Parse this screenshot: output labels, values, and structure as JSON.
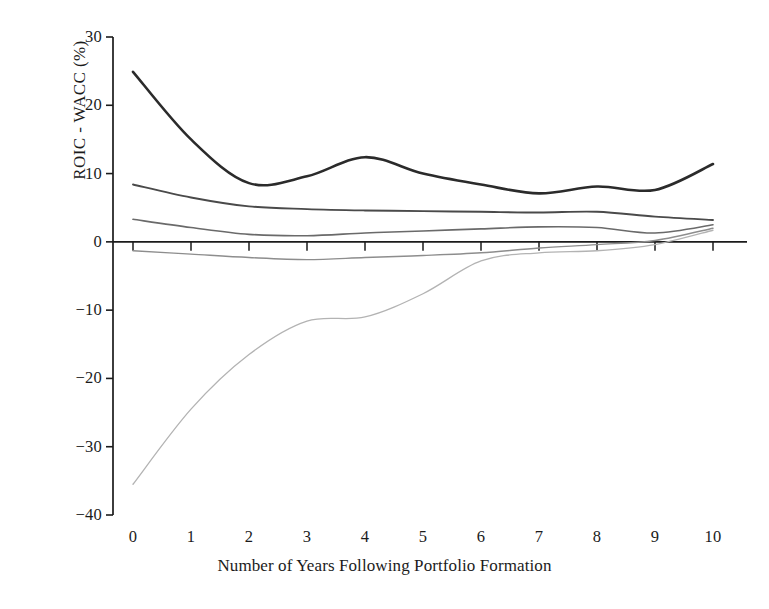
{
  "chart_data": {
    "type": "line",
    "title": "",
    "xlabel": "Number of Years Following Portfolio Formation",
    "ylabel": "ROIC - WACC (%)",
    "xlim": [
      0,
      10
    ],
    "ylim": [
      -40,
      30
    ],
    "xticks": [
      0,
      1,
      2,
      3,
      4,
      5,
      6,
      7,
      8,
      9,
      10
    ],
    "xtick_labels": [
      "0",
      "1",
      "2",
      "3",
      "4",
      "5",
      "6",
      "7",
      "8",
      "9",
      "10"
    ],
    "yticks": [
      -40,
      -30,
      -20,
      -10,
      0,
      10,
      20,
      30
    ],
    "ytick_labels": [
      "−40",
      "−30",
      "−20",
      "−10",
      "0",
      "10",
      "20",
      "30"
    ],
    "grid": false,
    "legend": "none",
    "x": [
      0,
      1,
      2,
      3,
      4,
      5,
      6,
      7,
      8,
      9,
      10
    ],
    "series": [
      {
        "name": "Quintile 1 (highest)",
        "color": "#2b2b2b",
        "width": 2.6,
        "values": [
          24.9,
          15.0,
          8.6,
          9.6,
          12.4,
          10.0,
          8.4,
          7.1,
          8.1,
          7.6,
          11.4
        ]
      },
      {
        "name": "Quintile 2",
        "color": "#4a4a4a",
        "width": 1.9,
        "values": [
          8.4,
          6.5,
          5.2,
          4.8,
          4.6,
          4.5,
          4.4,
          4.3,
          4.4,
          3.7,
          3.2
        ]
      },
      {
        "name": "Quintile 3",
        "color": "#6a6a6a",
        "width": 1.6,
        "values": [
          3.3,
          2.1,
          1.1,
          0.9,
          1.3,
          1.6,
          1.9,
          2.2,
          2.1,
          1.3,
          2.5
        ]
      },
      {
        "name": "Quintile 4",
        "color": "#8d8d8d",
        "width": 1.4,
        "values": [
          -1.3,
          -1.8,
          -2.3,
          -2.6,
          -2.3,
          -2.0,
          -1.6,
          -0.9,
          -0.4,
          0.2,
          2.0
        ]
      },
      {
        "name": "Quintile 5 (lowest)",
        "color": "#b3b3b3",
        "width": 1.3,
        "values": [
          -35.5,
          -24.5,
          -16.5,
          -11.6,
          -11.0,
          -7.6,
          -2.8,
          -1.6,
          -1.3,
          -0.4,
          1.7
        ]
      }
    ]
  },
  "axes": {
    "axis_color": "#1b1b1b",
    "tick_color": "#1b1b1b"
  }
}
